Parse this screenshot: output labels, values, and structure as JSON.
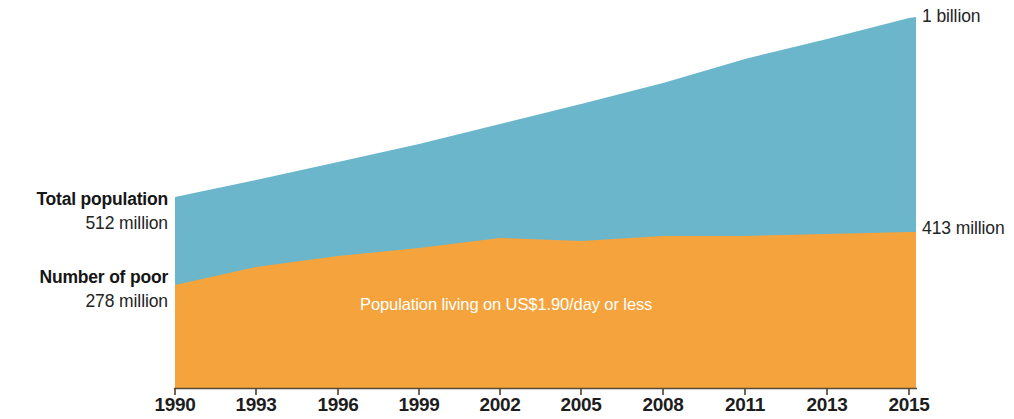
{
  "chart_data": {
    "type": "area",
    "stacked": true,
    "title": "",
    "subtitle": "",
    "xlabel": "",
    "ylabel": "",
    "grid": false,
    "legend_position": "none",
    "categories": [
      "1990",
      "1993",
      "1996",
      "1999",
      "2002",
      "2005",
      "2008",
      "2011",
      "2013",
      "2015"
    ],
    "x_tick_labels": [
      "1990",
      "1993",
      "1996",
      "1999",
      "2002",
      "2005",
      "2008",
      "2011",
      "2013",
      "2015"
    ],
    "ylim": [
      0,
      1000
    ],
    "y_unit": "millions of people",
    "series": [
      {
        "name": "Total population",
        "color": "#6cb6cc",
        "values": [
          512,
          570,
          628,
          686,
          744,
          800,
          855,
          905,
          955,
          1000
        ],
        "start_label": "512 million",
        "end_label": "1 billion"
      },
      {
        "name": "Number of poor",
        "color": "#f5a33c",
        "values": [
          278,
          330,
          365,
          388,
          412,
          405,
          404,
          407,
          410,
          413
        ],
        "start_label": "278 million",
        "end_label": "413 million"
      }
    ],
    "annotations": [
      {
        "name": "band-label",
        "text": "Population living on US$1.90/day or less",
        "color": "#ffffff",
        "placement": "inside-orange-band"
      }
    ],
    "axis_color": "#5a4a35"
  },
  "callouts": {
    "total_population": {
      "title": "Total population",
      "value": "512 million"
    },
    "number_of_poor": {
      "title": "Number of poor",
      "value": "278 million"
    }
  },
  "end_labels": {
    "total": "1 billion",
    "poor": "413 million"
  },
  "band_label": {
    "text": "Population living on US$1.90/day or less"
  },
  "x_axis": {
    "ticks": [
      {
        "label": "1990",
        "x": 175
      },
      {
        "label": "1993",
        "x": 256
      },
      {
        "label": "1996",
        "x": 338
      },
      {
        "label": "1999",
        "x": 419
      },
      {
        "label": "2002",
        "x": 500
      },
      {
        "label": "2005",
        "x": 581
      },
      {
        "label": "2008",
        "x": 663
      },
      {
        "label": "2011",
        "x": 745
      },
      {
        "label": "2013",
        "x": 827
      },
      {
        "label": "2015",
        "x": 909
      }
    ]
  },
  "colors": {
    "total_band": "#6cb6cc",
    "poor_band": "#f5a33c",
    "axis": "#5a4a35",
    "text": "#1a1a1a",
    "band_label_text": "#ffffff"
  }
}
